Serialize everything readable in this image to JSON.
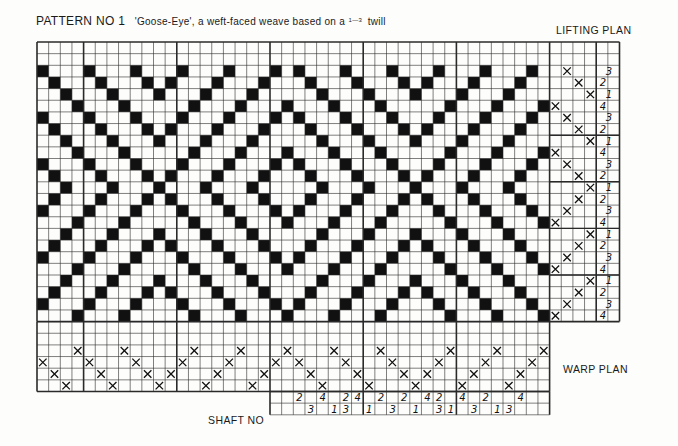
{
  "header": {
    "pattern_no": "PATTERN NO 1",
    "subtitle_pre": "'Goose-Eye', a weft-faced weave based on a",
    "twill_fraction": "1—3",
    "subtitle_post": "twill"
  },
  "labels": {
    "lifting_plan": "LIFTING PLAN",
    "warp_plan": "WARP PLAN",
    "shaft_no": "SHAFT NO"
  },
  "grid": {
    "origin_x": 37,
    "origin_y": 42,
    "cell": 11.65,
    "draft_cols": 44,
    "draft_rows": 24,
    "thick_cols": [
      4,
      12,
      20,
      28,
      36,
      44
    ],
    "lift_cols": 4,
    "lift_extra_cols": 2,
    "warp_rows": 6,
    "colors": {
      "ink": "#111111",
      "line": "#2a2a2a",
      "paper": "#fdfdfb"
    }
  },
  "threading": [
    3,
    2,
    1,
    4,
    3,
    2,
    1,
    4,
    3,
    2,
    1,
    2,
    3,
    4,
    1,
    2,
    3,
    4,
    1,
    2,
    3,
    4,
    3,
    2,
    1,
    4,
    3,
    2,
    1,
    4,
    3,
    2,
    1,
    2,
    3,
    4,
    1,
    2,
    3,
    4,
    1,
    2,
    3,
    4
  ],
  "lifting_plan": [
    null,
    null,
    3,
    2,
    1,
    4,
    3,
    2,
    1,
    4,
    3,
    2,
    1,
    2,
    3,
    4,
    1,
    2,
    3,
    4,
    1,
    2,
    3,
    4
  ],
  "shaft_numbers": {
    "start_col": 20,
    "upper": [
      "",
      "",
      "2",
      "",
      "4",
      "",
      "2",
      "4",
      "",
      "2",
      "",
      "2",
      "",
      "4",
      "2",
      "",
      "4",
      "",
      "2",
      "",
      "",
      "4"
    ],
    "lower": [
      "",
      "",
      "",
      "3",
      "",
      "1",
      "3",
      "",
      "1",
      "",
      "3",
      "",
      "1",
      "",
      "3",
      "1",
      "",
      "3",
      "",
      "1",
      "3",
      ""
    ]
  }
}
